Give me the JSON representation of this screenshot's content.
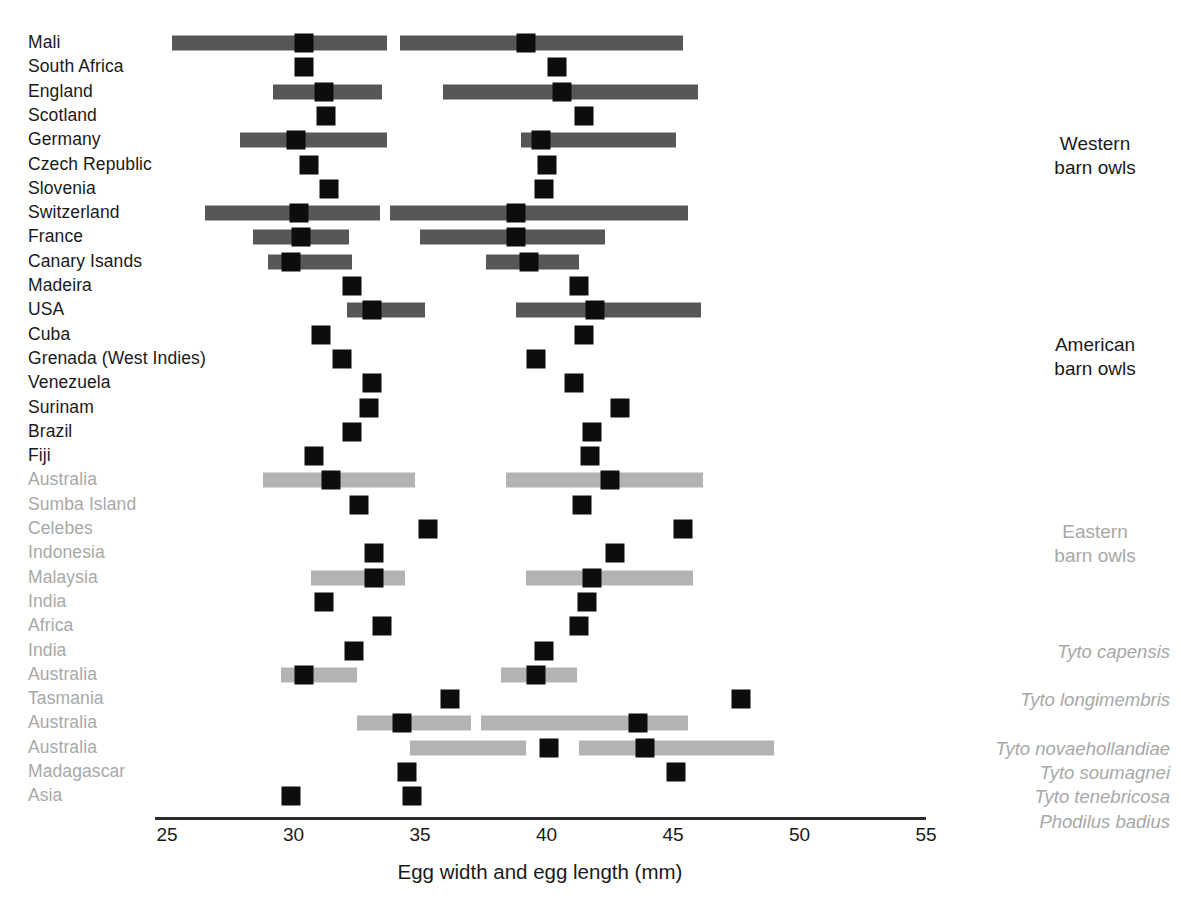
{
  "chart_data": {
    "type": "bar",
    "title": "",
    "xlabel": "Egg width and egg length (mm)",
    "ylabel": "",
    "xlim": [
      25,
      55
    ],
    "xticks": [
      25,
      30,
      35,
      40,
      45,
      50,
      55
    ],
    "grid": false,
    "legend_position": "right",
    "colors": {
      "dark_gray_bar": "#575757",
      "light_gray_bar": "#b3b3b3",
      "mean_marker": "#0d0d0d",
      "dark_text": "#1a1a1a",
      "light_text": "#a8a8a8",
      "axis": "#2b2b2b"
    },
    "groups": [
      {
        "name": "Western barn owls",
        "label_lines": "Western\nbarn owls",
        "text_color": "#3d3d3d",
        "bar_color": "#575757",
        "label_color": "#1a1a1a"
      },
      {
        "name": "American barn owls",
        "label_lines": "American\nbarn owls",
        "text_color": "#3d3d3d",
        "bar_color": "#575757",
        "label_color": "#1a1a1a"
      },
      {
        "name": "Eastern barn owls",
        "label_lines": "Eastern\nbarn owls",
        "text_color": "#a8a8a8",
        "bar_color": "#b3b3b3",
        "label_color": "#a8a8a8"
      }
    ],
    "species_labels": [
      {
        "text": "Tyto capensis",
        "row_index": 25
      },
      {
        "text": "Tyto longimembris",
        "row_index": 27
      },
      {
        "text": "Tyto novaehollandiae",
        "row_index": 29
      },
      {
        "text": "Tyto soumagnei",
        "row_index": 30
      },
      {
        "text": "Tyto tenebricosa",
        "row_index": 31
      },
      {
        "text": "Phodilus badius",
        "row_index": 32
      }
    ],
    "rows": [
      {
        "label": "Mali",
        "group": "Western barn owls",
        "dark": true,
        "width_mean": 30.4,
        "width_min": 25.2,
        "width_max": 33.7,
        "length_mean": 39.2,
        "length_max": 45.4,
        "length_min": 34.2
      },
      {
        "label": "South Africa",
        "group": "Western barn owls",
        "dark": true,
        "width_mean": 30.4,
        "width_min": null,
        "width_max": null,
        "length_mean": 40.4,
        "length_min": null,
        "length_max": null
      },
      {
        "label": "England",
        "group": "Western barn owls",
        "dark": true,
        "width_mean": 31.2,
        "width_min": 29.2,
        "width_max": 33.5,
        "length_mean": 40.6,
        "length_min": 35.9,
        "length_max": 46.0
      },
      {
        "label": "Scotland",
        "group": "Western barn owls",
        "dark": true,
        "width_mean": 31.3,
        "width_min": null,
        "width_max": null,
        "length_mean": 41.5,
        "length_min": null,
        "length_max": null
      },
      {
        "label": "Germany",
        "group": "Western barn owls",
        "dark": true,
        "width_mean": 30.1,
        "width_min": 27.9,
        "width_max": 33.7,
        "length_mean": 39.8,
        "length_min": 39.0,
        "length_max": 45.1
      },
      {
        "label": "Czech Republic",
        "group": "Western barn owls",
        "dark": true,
        "width_mean": 30.6,
        "width_min": null,
        "width_max": null,
        "length_mean": 40.0,
        "length_min": null,
        "length_max": null
      },
      {
        "label": "Slovenia",
        "group": "Western barn owls",
        "dark": true,
        "width_mean": 31.4,
        "width_min": null,
        "width_max": null,
        "length_mean": 39.9,
        "length_min": null,
        "length_max": null
      },
      {
        "label": "Switzerland",
        "group": "Western barn owls",
        "dark": true,
        "width_mean": 30.2,
        "width_min": 26.5,
        "width_max": 33.4,
        "length_mean": 38.8,
        "length_min": 33.8,
        "length_max": 45.6
      },
      {
        "label": "France",
        "group": "Western barn owls",
        "dark": true,
        "width_mean": 30.3,
        "width_min": 28.4,
        "width_max": 32.2,
        "length_mean": 38.8,
        "length_min": 35.0,
        "length_max": 42.3
      },
      {
        "label": "Canary Isands",
        "group": "Western barn owls",
        "dark": true,
        "width_mean": 29.9,
        "width_min": 29.0,
        "width_max": 32.3,
        "length_mean": 39.3,
        "length_min": 37.6,
        "length_max": 41.3
      },
      {
        "label": "Madeira",
        "group": "American barn owls",
        "dark": true,
        "width_mean": 32.3,
        "width_min": null,
        "width_max": null,
        "length_mean": 41.3,
        "length_min": null,
        "length_max": null
      },
      {
        "label": "USA",
        "group": "American barn owls",
        "dark": true,
        "width_mean": 33.1,
        "width_min": 32.1,
        "width_max": 35.2,
        "length_mean": 41.9,
        "length_min": 38.8,
        "length_max": 46.1
      },
      {
        "label": "Cuba",
        "group": "American barn owls",
        "dark": true,
        "width_mean": 31.1,
        "width_min": null,
        "width_max": null,
        "length_mean": 41.5,
        "length_min": null,
        "length_max": null
      },
      {
        "label": "Grenada (West Indies)",
        "group": "American barn owls",
        "dark": true,
        "width_mean": 31.9,
        "width_min": null,
        "width_max": null,
        "length_mean": 39.6,
        "length_min": null,
        "length_max": null
      },
      {
        "label": "Venezuela",
        "group": "American barn owls",
        "dark": true,
        "width_mean": 33.1,
        "width_min": null,
        "width_max": null,
        "length_mean": 41.1,
        "length_min": null,
        "length_max": null
      },
      {
        "label": "Surinam",
        "group": "American barn owls",
        "dark": true,
        "width_mean": 33.0,
        "width_min": null,
        "width_max": null,
        "length_mean": 42.9,
        "length_min": null,
        "length_max": null
      },
      {
        "label": "Brazil",
        "group": "American barn owls",
        "dark": true,
        "width_mean": 32.3,
        "width_min": null,
        "width_max": null,
        "length_mean": 41.8,
        "length_min": null,
        "length_max": null
      },
      {
        "label": "Fiji",
        "group": "Eastern barn owls",
        "dark": true,
        "width_mean": 30.8,
        "width_min": null,
        "width_max": null,
        "length_mean": 41.7,
        "length_min": null,
        "length_max": null
      },
      {
        "label": "Australia",
        "group": "Eastern barn owls",
        "dark": false,
        "width_mean": 31.5,
        "width_min": 28.8,
        "width_max": 34.8,
        "length_mean": 42.5,
        "length_min": 38.4,
        "length_max": 46.2
      },
      {
        "label": "Sumba Island",
        "group": "Eastern barn owls",
        "dark": false,
        "width_mean": 32.6,
        "width_min": null,
        "width_max": null,
        "length_mean": 41.4,
        "length_min": null,
        "length_max": null
      },
      {
        "label": "Celebes",
        "group": "Eastern barn owls",
        "dark": false,
        "width_mean": 35.3,
        "width_min": null,
        "width_max": null,
        "length_mean": 45.4,
        "length_min": null,
        "length_max": null
      },
      {
        "label": "Indonesia",
        "group": "Eastern barn owls",
        "dark": false,
        "width_mean": 33.2,
        "width_min": null,
        "width_max": null,
        "length_mean": 42.7,
        "length_min": null,
        "length_max": null
      },
      {
        "label": "Malaysia",
        "group": "Eastern barn owls",
        "dark": false,
        "width_mean": 33.2,
        "width_min": 30.7,
        "width_max": 34.4,
        "length_mean": 41.8,
        "length_min": 39.2,
        "length_max": 45.8
      },
      {
        "label": "India",
        "group": "Eastern barn owls",
        "dark": false,
        "width_mean": 31.2,
        "width_min": null,
        "width_max": null,
        "length_mean": 41.6,
        "length_min": null,
        "length_max": null
      },
      {
        "label": "Africa",
        "group": "Eastern barn owls",
        "dark": false,
        "width_mean": 33.5,
        "width_min": null,
        "width_max": null,
        "length_mean": 41.3,
        "length_min": null,
        "length_max": null
      },
      {
        "label": "India",
        "group": "Tyto capensis",
        "dark": false,
        "width_mean": 32.4,
        "width_min": null,
        "width_max": null,
        "length_mean": 39.9,
        "length_min": null,
        "length_max": null
      },
      {
        "label": "Australia",
        "group": "Tyto longimembris",
        "dark": false,
        "width_mean": 30.4,
        "width_min": 29.5,
        "width_max": 32.5,
        "length_mean": 39.6,
        "length_min": 38.2,
        "length_max": 41.2
      },
      {
        "label": "Tasmania",
        "group": "Tyto novaehollandiae",
        "dark": false,
        "width_mean": 36.2,
        "width_min": null,
        "width_max": null,
        "length_mean": 47.7,
        "length_min": null,
        "length_max": null
      },
      {
        "label": "Australia",
        "group": "Tyto novaehollandiae",
        "dark": false,
        "width_mean": 34.3,
        "width_min": 32.5,
        "width_max": 37.0,
        "length_mean": 43.6,
        "length_min": 37.4,
        "length_max": 45.6
      },
      {
        "label": "Australia",
        "group": "Tyto soumagnei",
        "dark": false,
        "width_mean": 40.1,
        "width_min": 34.6,
        "width_max": 39.2,
        "length_mean": 43.9,
        "length_min": 41.3,
        "length_max": 49.0
      },
      {
        "label": "Madagascar",
        "group": "Tyto tenebricosa",
        "dark": false,
        "width_mean": 34.5,
        "width_min": null,
        "width_max": null,
        "length_mean": 45.1,
        "length_min": null,
        "length_max": null
      },
      {
        "label": "Asia",
        "group": "Phodilus badius",
        "dark": false,
        "width_mean": 29.9,
        "width_min": null,
        "width_max": null,
        "length_mean": 34.7,
        "length_min": null,
        "length_max": null
      }
    ]
  }
}
